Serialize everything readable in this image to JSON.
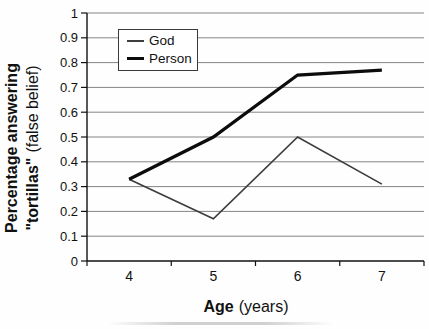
{
  "figure": {
    "background": "#fefefe"
  },
  "chart_data": {
    "type": "line",
    "title": "",
    "categories": [
      4,
      5,
      6,
      7
    ],
    "series": [
      {
        "name": "God",
        "values": [
          0.33,
          0.17,
          0.5,
          0.31
        ],
        "color": "#3d3d3d",
        "stroke_width": 1.7
      },
      {
        "name": "Person",
        "values": [
          0.33,
          0.5,
          0.75,
          0.77
        ],
        "color": "#0c0c0c",
        "stroke_width": 3.3
      }
    ],
    "xlabel_bold": "Age",
    "xlabel_regular": "(years)",
    "ylabel_line1": "Percentage answering",
    "ylabel_line2_bold": "\"tortillas\"",
    "ylabel_line2_regular": "(false belief)",
    "ylim": [
      0,
      1
    ],
    "yticks": [
      0,
      0.1,
      0.2,
      0.3,
      0.4,
      0.5,
      0.6,
      0.7,
      0.8,
      0.9,
      1
    ],
    "ytick_labels": [
      "0",
      "0.1",
      "0.2",
      "0.3",
      "0.4",
      "0.5",
      "0.6",
      "0.7",
      "0.8",
      "0.9",
      "1"
    ],
    "xtick_labels": [
      "4",
      "5",
      "6",
      "7"
    ],
    "grid": "horizontal",
    "legend_position": "top-left-inside",
    "gridline_color": "#858585",
    "axis_color": "#111111"
  }
}
